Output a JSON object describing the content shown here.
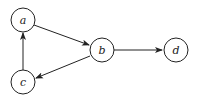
{
  "diagram": {
    "type": "directed-graph",
    "nodes": [
      {
        "id": "a",
        "label": "a",
        "x": 23,
        "y": 20
      },
      {
        "id": "b",
        "label": "b",
        "x": 102,
        "y": 50
      },
      {
        "id": "c",
        "label": "c",
        "x": 23,
        "y": 82
      },
      {
        "id": "d",
        "label": "d",
        "x": 176,
        "y": 50
      }
    ],
    "edges": [
      {
        "from": "a",
        "to": "b"
      },
      {
        "from": "b",
        "to": "d"
      },
      {
        "from": "b",
        "to": "c"
      },
      {
        "from": "c",
        "to": "a"
      }
    ],
    "colors": {
      "stroke": "#222222",
      "background": "#ffffff"
    }
  }
}
